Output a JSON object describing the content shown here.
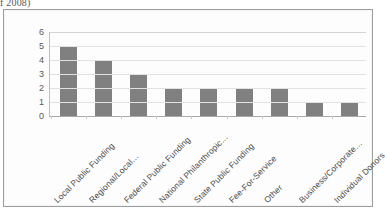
{
  "page": {
    "top_fragment_text": "f 2008)"
  },
  "chart": {
    "bar_color": "#808080",
    "plot_background": "#ffffff",
    "gridline_color": "#e2e2e2",
    "axis_color": "#a9a9a9",
    "frame_border_color": "#9d9d9d"
  },
  "chart_data": {
    "type": "bar",
    "title": "",
    "xlabel": "",
    "ylabel": "",
    "ylim": [
      0,
      6
    ],
    "yticks": [
      0,
      1,
      2,
      3,
      4,
      5,
      6
    ],
    "grid": true,
    "legend": false,
    "categories": [
      "Local Public Funding",
      "Regional/Local…",
      "Federal Public Funding",
      "National Philanthropic…",
      "State Public Funding",
      "Fee-For-Service",
      "Other",
      "Business/Corporate…",
      "Individual Donors"
    ],
    "values": [
      5,
      4,
      3,
      2,
      2,
      2,
      2,
      1,
      1
    ]
  }
}
